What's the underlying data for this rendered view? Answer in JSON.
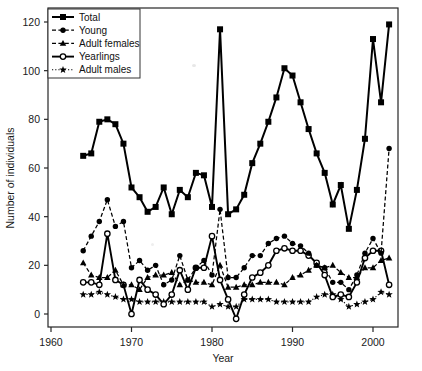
{
  "chart_data": {
    "type": "line",
    "title": "",
    "xlabel": "Year",
    "ylabel": "Number of individuals",
    "xlim": [
      1960,
      2004
    ],
    "ylim": [
      -4,
      124
    ],
    "xticks": [
      1960,
      1970,
      1980,
      1990,
      2000
    ],
    "yticks": [
      0,
      20,
      40,
      60,
      80,
      100,
      120
    ],
    "grid": false,
    "legend_position": "top-left",
    "x": [
      1964,
      1965,
      1966,
      1967,
      1968,
      1969,
      1970,
      1971,
      1972,
      1973,
      1974,
      1975,
      1976,
      1977,
      1978,
      1979,
      1980,
      1981,
      1982,
      1983,
      1984,
      1985,
      1986,
      1987,
      1988,
      1989,
      1990,
      1991,
      1992,
      1993,
      1994,
      1995,
      1996,
      1997,
      1998,
      1999,
      2000,
      2001,
      2002
    ],
    "series": [
      {
        "name": "Total",
        "marker": "filled-square",
        "line": "solid",
        "values": [
          65,
          66,
          79,
          80,
          78,
          70,
          52,
          48,
          42,
          44,
          52,
          41,
          51,
          48,
          58,
          57,
          44,
          117,
          41,
          43,
          49,
          62,
          70,
          79,
          89,
          101,
          98,
          87,
          76,
          66,
          58,
          45,
          53,
          35,
          51,
          72,
          113,
          87,
          119
        ]
      },
      {
        "name": "Young",
        "marker": "filled-circle",
        "line": "dashed",
        "values": [
          26,
          32,
          38,
          47,
          36,
          38,
          19,
          22,
          18,
          20,
          12,
          14,
          24,
          14,
          19,
          22,
          16,
          43,
          15,
          15,
          19,
          24,
          24,
          29,
          31,
          32,
          29,
          28,
          25,
          20,
          19,
          13,
          13,
          10,
          16,
          25,
          31,
          25,
          68
        ]
      },
      {
        "name": "Adult females",
        "marker": "filled-triangle",
        "line": "dashed",
        "values": [
          21,
          16,
          15,
          15,
          18,
          12,
          12,
          10,
          15,
          16,
          16,
          17,
          12,
          14,
          13,
          13,
          12,
          20,
          11,
          11,
          12,
          12,
          13,
          13,
          13,
          12,
          15,
          16,
          18,
          20,
          19,
          20,
          17,
          15,
          15,
          19,
          19,
          22,
          23
        ]
      },
      {
        "name": "Yearlings",
        "marker": "open-circle",
        "line": "solid",
        "values": [
          13,
          13,
          12,
          33,
          14,
          12,
          0,
          14,
          10,
          8,
          4,
          8,
          18,
          10,
          19,
          19,
          32,
          14,
          6,
          -2,
          8,
          15,
          17,
          20,
          26,
          27,
          26,
          26,
          24,
          21,
          16,
          7,
          8,
          7,
          13,
          23,
          26,
          26,
          12
        ]
      },
      {
        "name": "Adult males",
        "marker": "filled-star",
        "line": "dotted",
        "values": [
          8,
          8,
          9,
          8,
          7,
          6,
          6,
          5,
          5,
          5,
          5,
          5,
          5,
          5,
          5,
          5,
          3,
          4,
          3,
          3,
          6,
          6,
          6,
          6,
          5,
          5,
          5,
          5,
          5,
          7,
          8,
          8,
          6,
          3,
          4,
          5,
          6,
          9,
          8
        ]
      }
    ]
  },
  "legend": {
    "entries": [
      {
        "label": "Total"
      },
      {
        "label": "Young"
      },
      {
        "label": "Adult females"
      },
      {
        "label": "Yearlings"
      },
      {
        "label": "Adult males"
      }
    ]
  },
  "axes": {
    "x_tick_labels": [
      "1960",
      "1970",
      "1980",
      "1990",
      "2000"
    ],
    "y_tick_labels": [
      "0",
      "20",
      "40",
      "60",
      "80",
      "100",
      "120"
    ],
    "x_axis_title": "Year",
    "y_axis_title": "Number of individuals"
  }
}
